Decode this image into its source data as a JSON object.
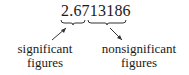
{
  "number": "2.6713186",
  "labels": {
    "significant": [
      "significant",
      "figures"
    ],
    "nonsignificant": [
      "nonsignificant",
      "figures"
    ]
  },
  "groups": {
    "significant_digits": "2.67",
    "nonsignificant_digits": "13186"
  }
}
